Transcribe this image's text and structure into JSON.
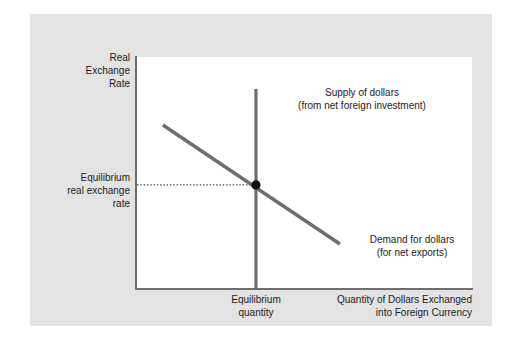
{
  "figure": {
    "panel_color": "#e3e3e3",
    "plot_background": "#ffffff",
    "axis_color": "#6e6e6e",
    "curve_color": "#6e6e6e",
    "point_color": "#111111",
    "text_color": "#1c1c1c"
  },
  "chart_data": {
    "type": "line",
    "title": "",
    "xlabel": "Quantity of Dollars Exchanged\ninto Foreign Currency",
    "ylabel": "Real\nExchange\nRate",
    "grid": false,
    "legend": "inline-annotations",
    "xlim": [
      0,
      1
    ],
    "ylim": [
      0,
      1
    ],
    "series": [
      {
        "name": "Supply of dollars",
        "sublabel": "(from net foreign investment)",
        "label": "Supply of dollars\n(from net foreign investment)",
        "shape": "vertical",
        "x": [
          0.357,
          0.357
        ],
        "y": [
          0.863,
          0.0
        ],
        "description": "Perfectly inelastic vertical supply curve at the equilibrium quantity"
      },
      {
        "name": "Demand for dollars",
        "sublabel": "(for net exports)",
        "label": "Demand for dollars\n(for net exports)",
        "shape": "downward-sloping",
        "x": [
          0.08,
          0.607
        ],
        "y": [
          0.708,
          0.197
        ],
        "description": "Downward sloping demand curve for dollars"
      }
    ],
    "equilibrium": {
      "x": 0.357,
      "y": 0.451,
      "rate_label": "Equilibrium\nreal exchange\nrate",
      "quantity_label": "Equilibrium\nquantity",
      "marker": "filled-circle",
      "guide_line_style": "dotted"
    }
  },
  "annotations": {
    "y_axis_title": "Real\nExchange\nRate",
    "x_axis_title": "Quantity of Dollars Exchanged\ninto Foreign Currency",
    "equilibrium_rate": "Equilibrium\nreal exchange\nrate",
    "equilibrium_quantity": "Equilibrium\nquantity",
    "supply_label": "Supply of dollars\n(from net foreign investment)",
    "demand_label": "Demand for dollars\n(for net exports)"
  }
}
